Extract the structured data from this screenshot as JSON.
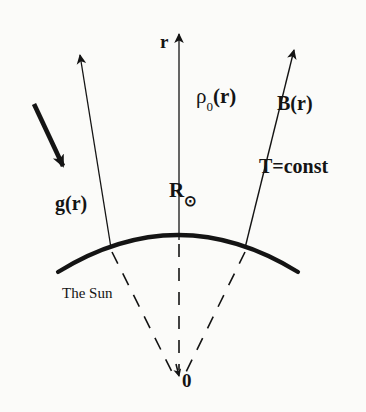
{
  "figure": {
    "name": "solar-atmosphere-schematic",
    "background_color": "#fbfbf9",
    "ink_color": "#141414",
    "width": 366,
    "height": 412
  },
  "labels": {
    "radial_vector": "r",
    "density": "ρ",
    "density_subscript": "0",
    "density_argument": "(r)",
    "magnetic_field": "B(r)",
    "temperature": "T=const",
    "gravity": "g(r)",
    "solar_radius": "R",
    "solar_radius_symbol": "⊙",
    "body_caption": "The Sun",
    "origin": "0"
  },
  "elements": {
    "limb_arc": "solar-surface-arc",
    "radial_axis": "vertical-radial-line",
    "left_field_line": "left-field-line-arrow",
    "right_field_line": "right-field-line-arrow",
    "gravity_arrow": "gravity-vector-arrow",
    "dashed_radii": [
      "dashed-radius-left",
      "dashed-radius-center",
      "dashed-radius-right"
    ],
    "origin_arrowhead": "origin-arrowhead"
  }
}
